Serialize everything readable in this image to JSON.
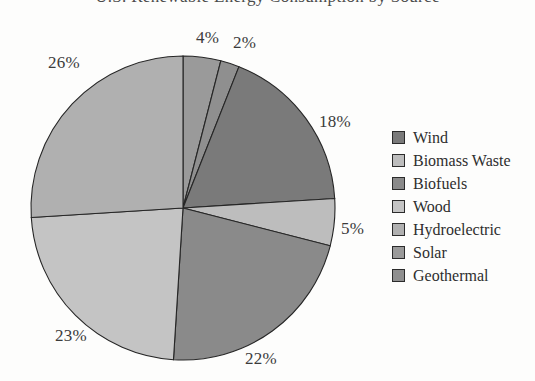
{
  "chart": {
    "title": "U.S. Renewable Energy Consumption by Source",
    "legend_position": "right"
  },
  "chart_data": {
    "type": "pie",
    "title": "U.S. Renewable Energy Consumption by Source",
    "xlabel": "",
    "ylabel": "",
    "categories": [
      "Wind",
      "Biomass Waste",
      "Biofuels",
      "Wood",
      "Hydroelectric",
      "Solar",
      "Geothermal"
    ],
    "values": [
      18,
      5,
      22,
      23,
      26,
      4,
      2
    ],
    "labels": [
      "18%",
      "5%",
      "22%",
      "23%",
      "26%",
      "4%",
      "2%"
    ],
    "colors": [
      "#7a7a7a",
      "#bdbdbd",
      "#8a8a8a",
      "#c4c4c4",
      "#b0b0b0",
      "#9a9a9a",
      "#8f8f8f"
    ],
    "slices": [
      {
        "name": "Solar",
        "value": 4,
        "label": "4%",
        "color": "#9a9a9a",
        "label_x": 196,
        "label_y": 28
      },
      {
        "name": "Geothermal",
        "value": 2,
        "label": "2%",
        "color": "#8f8f8f",
        "label_x": 233,
        "label_y": 33
      },
      {
        "name": "Wind",
        "value": 18,
        "label": "18%",
        "color": "#7a7a7a",
        "label_x": 319,
        "label_y": 112
      },
      {
        "name": "Biomass Waste",
        "value": 5,
        "label": "5%",
        "color": "#bdbdbd",
        "label_x": 341,
        "label_y": 219
      },
      {
        "name": "Biofuels",
        "value": 22,
        "label": "22%",
        "color": "#8a8a8a",
        "label_x": 245,
        "label_y": 349
      },
      {
        "name": "Wood",
        "value": 23,
        "label": "23%",
        "color": "#c4c4c4",
        "label_x": 55,
        "label_y": 326
      },
      {
        "name": "Hydroelectric",
        "value": 26,
        "label": "26%",
        "color": "#b0b0b0",
        "label_x": 48,
        "label_y": 53
      }
    ],
    "legend": [
      {
        "label": "Wind",
        "color": "#7a7a7a"
      },
      {
        "label": "Biomass Waste",
        "color": "#bdbdbd"
      },
      {
        "label": "Biofuels",
        "color": "#8a8a8a"
      },
      {
        "label": "Wood",
        "color": "#c4c4c4"
      },
      {
        "label": "Hydroelectric",
        "color": "#b0b0b0"
      },
      {
        "label": "Solar",
        "color": "#9a9a9a"
      },
      {
        "label": "Geothermal",
        "color": "#8f8f8f"
      }
    ],
    "geometry": {
      "cx": 183,
      "cy": 208,
      "r": 152,
      "start_angle_deg": -90
    },
    "total": 100,
    "units": "percent"
  }
}
